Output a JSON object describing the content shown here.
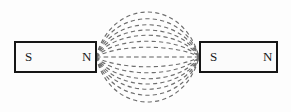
{
  "figure": {
    "canvas": {
      "width": 291,
      "height": 112,
      "background": "#fdfdfd"
    },
    "magnets": [
      {
        "id": "left-magnet",
        "x": 14,
        "y": 41,
        "width": 82,
        "height": 31,
        "left_pole_label": "S",
        "right_pole_label": "N",
        "left_pole_label_x": 25,
        "right_pole_label_x": 87,
        "label_y": 57,
        "stroke": "#161616",
        "fill": "#fbfbfb"
      },
      {
        "id": "right-magnet",
        "x": 199,
        "y": 41,
        "width": 79,
        "height": 31,
        "left_pole_label": "S",
        "right_pole_label": "N",
        "left_pole_label_x": 210,
        "right_pole_label_x": 268,
        "label_y": 57,
        "stroke": "#161616",
        "fill": "#fbfbfb"
      }
    ],
    "field": {
      "style": "dashed",
      "color": "#6e6e6e",
      "dash_pattern": "4.2 3.2",
      "stroke_width": 1.15,
      "left_pole_tip_x": 96,
      "right_pole_tip_x": 199,
      "axis_y": 57,
      "line_count": 13,
      "bulge_offsets": [
        -50,
        -41,
        -32,
        -24,
        -16,
        -8,
        0,
        8,
        16,
        24,
        32,
        41,
        49
      ],
      "top_extent_y": 7,
      "bottom_extent_y": 106
    }
  }
}
